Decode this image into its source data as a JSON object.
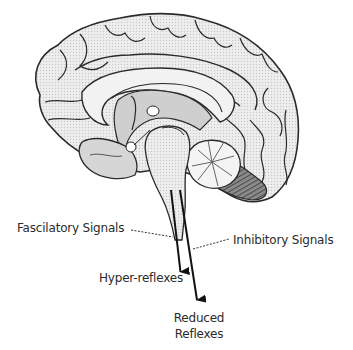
{
  "figure": {
    "labels": {
      "fascilatory": "Fascilatory Signals",
      "inhibitory": "Inhibitory Signals",
      "hyper_reflexes": "Hyper-reflexes",
      "reduced_reflexes_line1": "Reduced",
      "reduced_reflexes_line2": "Reflexes"
    },
    "arrows": [
      {
        "name": "fascilatory-pathway",
        "from": [
          171,
          190
        ],
        "to": [
          181,
          272
        ],
        "target": "Hyper-reflexes"
      },
      {
        "name": "inhibitory-pathway",
        "from": [
          180,
          190
        ],
        "to": [
          197,
          300
        ],
        "target": "Reduced Reflexes"
      }
    ],
    "colors": {
      "outline": "#2a2a2a",
      "fill": "#e6e6e6",
      "shade": "#bdbdbd",
      "text": "#2b2b2b",
      "background": "#ffffff"
    }
  }
}
